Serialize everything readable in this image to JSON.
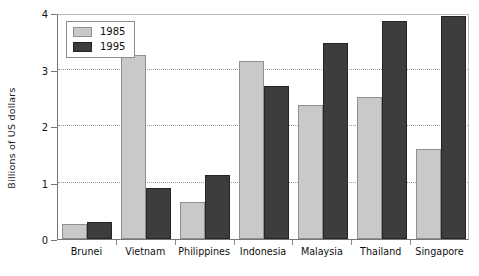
{
  "chart_data": {
    "type": "bar",
    "title": "",
    "subtitle": "",
    "xlabel": "",
    "ylabel": "Billions of US dollars",
    "categories": [
      "Brunei",
      "Vietnam",
      "Philippines",
      "Indonesia",
      "Malaysia",
      "Thailand",
      "Singapore"
    ],
    "series": [
      {
        "name": "1985",
        "color": "#c9c9c9",
        "values": [
          0.27,
          3.25,
          0.65,
          3.15,
          2.38,
          2.52,
          1.6
        ]
      },
      {
        "name": "1995",
        "color": "#3d3d3d",
        "values": [
          0.3,
          0.9,
          1.13,
          2.7,
          3.47,
          3.85,
          3.95
        ]
      }
    ],
    "ylim": [
      0,
      4
    ],
    "yticks": [
      0,
      1,
      2,
      3,
      4
    ],
    "ytick_labels": [
      "0",
      "1",
      "2",
      "3",
      "4"
    ],
    "grid": "horizontal-dotted",
    "legend_position": "top-left-inside"
  },
  "legend": {
    "entries": [
      {
        "label": "1985",
        "swatch": "light-gray-swatch"
      },
      {
        "label": "1995",
        "swatch": "dark-gray-swatch"
      }
    ]
  }
}
